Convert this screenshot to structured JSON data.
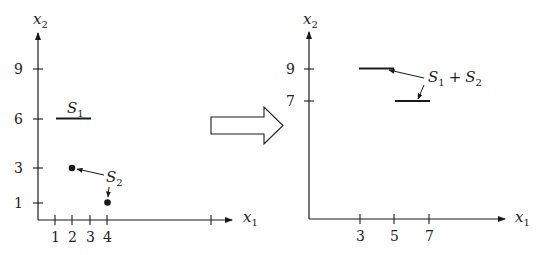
{
  "left_panel": {
    "y_axis_label": "x",
    "y_axis_label_sub": "2",
    "x_axis_label": "x",
    "x_axis_label_sub": "1",
    "y_ticks": [
      "9",
      "6",
      "3",
      "1"
    ],
    "x_ticks": [
      "1",
      "2",
      "3",
      "4"
    ],
    "set1": {
      "label": "S",
      "sub": "1",
      "segment": {
        "x_from": 1,
        "x_to": 3,
        "y": 6
      }
    },
    "set2": {
      "label": "S",
      "sub": "2",
      "points": [
        {
          "x": 2,
          "y": 3
        },
        {
          "x": 4,
          "y": 1
        }
      ]
    }
  },
  "transform_arrow": {
    "direction": "right",
    "style": "hollow"
  },
  "right_panel": {
    "y_axis_label": "x",
    "y_axis_label_sub": "2",
    "x_axis_label": "x",
    "x_axis_label_sub": "1",
    "y_ticks": [
      "9",
      "7"
    ],
    "x_ticks": [
      "3",
      "5",
      "7"
    ],
    "sum": {
      "label_a": "S",
      "label_a_sub": "1",
      "operator": "+",
      "label_b": "S",
      "label_b_sub": "2",
      "segments": [
        {
          "x_from": 3,
          "x_to": 5,
          "y": 9
        },
        {
          "x_from": 5,
          "x_to": 7,
          "y": 7
        }
      ]
    }
  },
  "colors": {
    "ink": "#1a1a1a",
    "background": "#ffffff"
  }
}
